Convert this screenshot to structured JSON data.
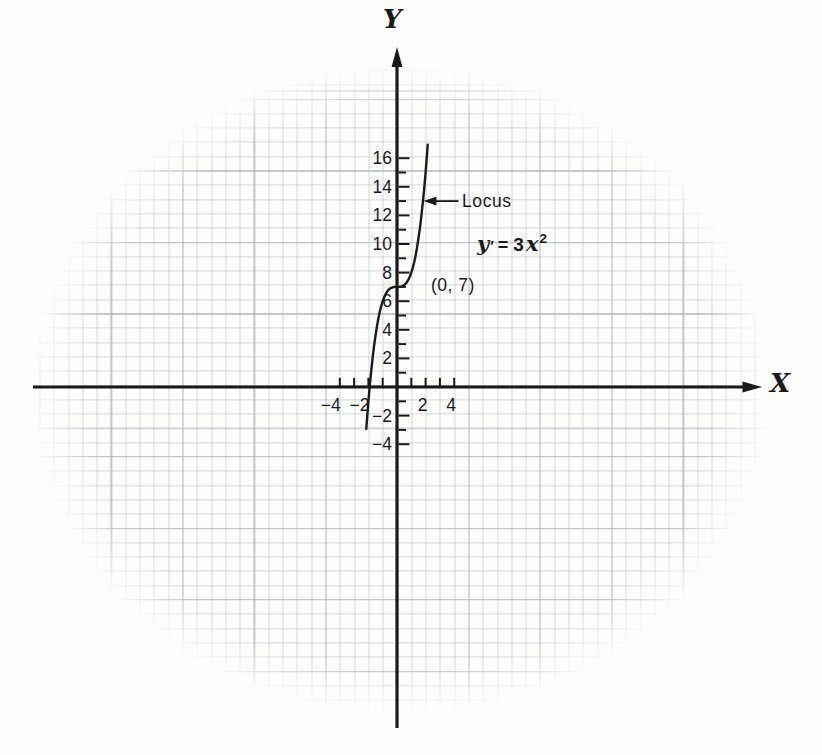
{
  "colors": {
    "ink": "#1a1a1a",
    "paper": "#fdfdfc",
    "grid_line": "#c3c8ce"
  },
  "chart_data": {
    "type": "line",
    "title": "",
    "grid": true,
    "x_axis": {
      "label": "X",
      "ticks": [
        -4,
        -3,
        -2,
        -1,
        1,
        2,
        3,
        4
      ],
      "labeled_ticks": [
        -4,
        -2,
        2,
        4
      ],
      "range_shown": [
        -25.5,
        26.5
      ]
    },
    "y_axis": {
      "label": "Y",
      "ticks": [
        -4,
        -3,
        -2,
        -1,
        1,
        2,
        3,
        4,
        5,
        6,
        7,
        8,
        9,
        10,
        11,
        12,
        13,
        14,
        15,
        16
      ],
      "labeled_ticks": [
        16,
        14,
        12,
        10,
        8,
        6,
        4,
        2,
        -2,
        -4
      ],
      "range_shown": [
        -24,
        24
      ]
    },
    "equation": {
      "text": "y′ = 3x²",
      "y": "y",
      "prime": "′",
      "equals": "=",
      "coefficient": "3",
      "variable": "x",
      "exponent": "2"
    },
    "annotations": [
      {
        "name": "locus",
        "text": "Locus",
        "target_xy": [
          1.85,
          13.0
        ],
        "tail_xy": [
          4.3,
          13.0
        ]
      },
      {
        "name": "point",
        "text": "(0, 7)",
        "point": [
          0,
          7
        ]
      },
      {
        "name": "equation",
        "text": "y′ = 3x²"
      }
    ],
    "series": [
      {
        "name": "Locus",
        "relation": "curve through (0, 7) whose slope is 3x²",
        "points": [
          [
            -2.15,
            -2.938
          ],
          [
            -2.1,
            -2.261
          ],
          [
            -2.0,
            -1.0
          ],
          [
            -1.9,
            0.141
          ],
          [
            -1.8,
            1.168
          ],
          [
            -1.7,
            2.087
          ],
          [
            -1.6,
            2.904
          ],
          [
            -1.5,
            3.625
          ],
          [
            -1.4,
            4.256
          ],
          [
            -1.3,
            4.803
          ],
          [
            -1.2,
            5.272
          ],
          [
            -1.1,
            5.669
          ],
          [
            -1.0,
            6.0
          ],
          [
            -0.9,
            6.271
          ],
          [
            -0.8,
            6.488
          ],
          [
            -0.7,
            6.657
          ],
          [
            -0.6,
            6.784
          ],
          [
            -0.5,
            6.875
          ],
          [
            -0.4,
            6.936
          ],
          [
            -0.3,
            6.973
          ],
          [
            -0.2,
            6.992
          ],
          [
            -0.1,
            6.999
          ],
          [
            0,
            7.0
          ],
          [
            0.1,
            7.001
          ],
          [
            0.2,
            7.008
          ],
          [
            0.3,
            7.027
          ],
          [
            0.4,
            7.064
          ],
          [
            0.5,
            7.125
          ],
          [
            0.6,
            7.216
          ],
          [
            0.7,
            7.343
          ],
          [
            0.8,
            7.512
          ],
          [
            0.9,
            7.729
          ],
          [
            1.0,
            8.0
          ],
          [
            1.1,
            8.331
          ],
          [
            1.2,
            8.728
          ],
          [
            1.3,
            9.197
          ],
          [
            1.4,
            9.744
          ],
          [
            1.5,
            10.375
          ],
          [
            1.6,
            11.096
          ],
          [
            1.7,
            11.913
          ],
          [
            1.8,
            12.832
          ],
          [
            1.9,
            13.859
          ],
          [
            2.0,
            15.0
          ],
          [
            2.1,
            16.261
          ],
          [
            2.15,
            16.938
          ]
        ]
      }
    ]
  }
}
